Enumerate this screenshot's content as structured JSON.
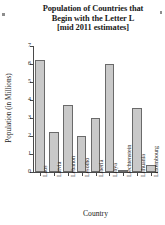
{
  "chart_data": {
    "type": "bar",
    "title": "Population of Countries that Begin with the Letter L [mid 2011 estimates]",
    "title_lines": [
      "Population of Countries that",
      "Begin with the Letter L",
      "[mid 2011 estimates]"
    ],
    "xlabel": "Country",
    "ylabel": "Population (in Millions)",
    "categories": [
      "Laos",
      "Latvia",
      "Lebanon",
      "Lesotho",
      "Liberia",
      "Libya",
      "Liechtenstein",
      "Lithuania",
      "Luxembourg"
    ],
    "values": [
      6.25,
      2.25,
      3.75,
      2.0,
      3.0,
      6.0,
      0.1,
      3.55,
      0.4
    ],
    "ylim": [
      0,
      7
    ],
    "yticks": [
      0,
      1,
      2,
      3,
      4,
      5,
      6,
      7
    ],
    "ytick_labels": [
      "0",
      "1",
      "2",
      "3",
      "4",
      "5",
      "6",
      "7"
    ],
    "grid": false,
    "legend": false,
    "bar_fill_color": "#c9c9c9",
    "bar_edge_color": "#6a6a6a",
    "axis_color": "#4a4a4a",
    "background_color": "#ffffff"
  }
}
